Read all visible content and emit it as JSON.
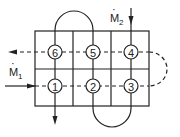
{
  "diagram": {
    "inlets": [
      {
        "label": "M",
        "subscript": "1",
        "dot": "·"
      },
      {
        "label": "M",
        "subscript": "2",
        "dot": "·"
      }
    ],
    "nodes": [
      {
        "id": "1",
        "label": "1"
      },
      {
        "id": "2",
        "label": "2"
      },
      {
        "id": "3",
        "label": "3"
      },
      {
        "id": "4",
        "label": "4"
      },
      {
        "id": "5",
        "label": "5"
      },
      {
        "id": "6",
        "label": "6"
      }
    ],
    "colors": {
      "line": "#222222",
      "background": "#ffffff"
    }
  }
}
